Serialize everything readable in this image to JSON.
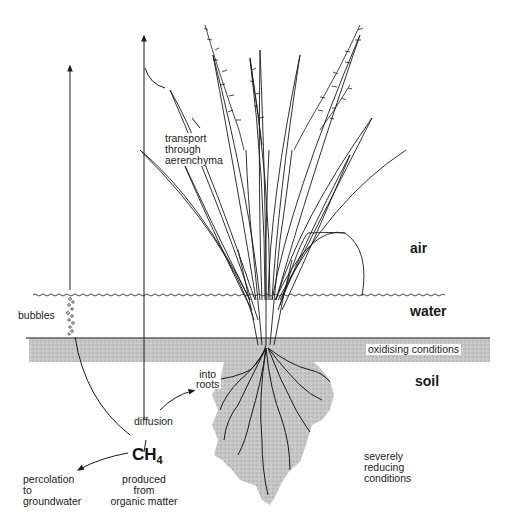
{
  "diagram": {
    "zones": {
      "air": "air",
      "water": "water",
      "soil": "soil"
    },
    "labels": {
      "transport": [
        "transport",
        "through",
        "aerenchyma"
      ],
      "bubbles": "bubbles",
      "oxidising": "oxidising conditions",
      "into_roots": [
        "into",
        "roots"
      ],
      "diffusion": "diffusion",
      "ch4_main": "CH",
      "ch4_sub": "4",
      "percolation": [
        "percolation",
        "to",
        "groundwater"
      ],
      "produced": [
        "produced",
        "from",
        "organic matter"
      ],
      "reducing": [
        "severely",
        "reducing",
        "conditions"
      ]
    },
    "colors": {
      "ink": "#1a1a1a",
      "soil_shade": "#bdbdbd",
      "background": "#ffffff"
    }
  }
}
